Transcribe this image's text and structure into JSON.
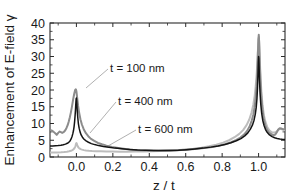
{
  "chart_data": {
    "type": "line",
    "title": "",
    "xlabel": "z / t",
    "ylabel": "Enhancement of E-field γ",
    "xlim": [
      -0.145,
      1.145
    ],
    "ylim": [
      0,
      40
    ],
    "xticks": [
      0.0,
      0.2,
      0.4,
      0.6,
      0.8,
      1.0
    ],
    "xticklabels": [
      "0.0",
      "0.2",
      "0.4",
      "0.6",
      "0.8",
      "1.0"
    ],
    "yticks": [
      0,
      5,
      10,
      15,
      20,
      25,
      30,
      35,
      40
    ],
    "yticklabels": [
      "0",
      "5",
      "10",
      "15",
      "20",
      "25",
      "30",
      "35",
      "40"
    ],
    "grid": false,
    "legend_position": "inline-annotations",
    "annotations": [
      {
        "text": "t = 100 nm",
        "x_px": 110,
        "y_px": 72,
        "leader_to_x_px": 86,
        "leader_to_y_px": 88
      },
      {
        "text": "t = 400 nm",
        "x_px": 118,
        "y_px": 105,
        "leader_to_x_px": 90,
        "leader_to_y_px": 133
      },
      {
        "text": "t = 600 nm",
        "x_px": 138,
        "y_px": 133,
        "leader_to_x_px": 108,
        "leader_to_y_px": 146
      }
    ],
    "series": [
      {
        "name": "t = 100 nm",
        "color": "#8c8c8c",
        "linewidth": 2.0,
        "points": [
          [
            -0.145,
            8.0
          ],
          [
            -0.135,
            7.9
          ],
          [
            -0.125,
            7.5
          ],
          [
            -0.115,
            7.0
          ],
          [
            -0.108,
            6.6
          ],
          [
            -0.1,
            7.2
          ],
          [
            -0.092,
            7.6
          ],
          [
            -0.085,
            7.4
          ],
          [
            -0.078,
            7.2
          ],
          [
            -0.07,
            7.4
          ],
          [
            -0.062,
            7.9
          ],
          [
            -0.055,
            8.6
          ],
          [
            -0.048,
            9.5
          ],
          [
            -0.042,
            10.6
          ],
          [
            -0.036,
            11.9
          ],
          [
            -0.03,
            13.4
          ],
          [
            -0.024,
            15.2
          ],
          [
            -0.018,
            17.2
          ],
          [
            -0.012,
            18.9
          ],
          [
            -0.007,
            20.0
          ],
          [
            -0.003,
            20.2
          ],
          [
            0.0,
            19.6
          ],
          [
            0.004,
            17.8
          ],
          [
            0.009,
            15.4
          ],
          [
            0.015,
            13.2
          ],
          [
            0.022,
            11.3
          ],
          [
            0.03,
            9.7
          ],
          [
            0.04,
            8.3
          ],
          [
            0.052,
            7.1
          ],
          [
            0.065,
            6.2
          ],
          [
            0.08,
            5.4
          ],
          [
            0.098,
            4.8
          ],
          [
            0.118,
            4.2
          ],
          [
            0.14,
            3.8
          ],
          [
            0.165,
            3.4
          ],
          [
            0.195,
            3.0
          ],
          [
            0.23,
            2.7
          ],
          [
            0.27,
            2.4
          ],
          [
            0.31,
            2.2
          ],
          [
            0.35,
            2.05
          ],
          [
            0.4,
            1.95
          ],
          [
            0.45,
            1.9
          ],
          [
            0.5,
            1.95
          ],
          [
            0.55,
            2.05
          ],
          [
            0.6,
            2.2
          ],
          [
            0.65,
            2.4
          ],
          [
            0.7,
            2.7
          ],
          [
            0.745,
            3.0
          ],
          [
            0.785,
            3.4
          ],
          [
            0.82,
            3.9
          ],
          [
            0.85,
            4.4
          ],
          [
            0.878,
            5.1
          ],
          [
            0.9,
            5.8
          ],
          [
            0.92,
            6.7
          ],
          [
            0.937,
            7.8
          ],
          [
            0.951,
            9.2
          ],
          [
            0.962,
            10.8
          ],
          [
            0.971,
            12.6
          ],
          [
            0.978,
            14.8
          ],
          [
            0.984,
            17.6
          ],
          [
            0.989,
            21.0
          ],
          [
            0.993,
            25.5
          ],
          [
            0.996,
            30.5
          ],
          [
            0.999,
            35.0
          ],
          [
            1.001,
            36.5
          ],
          [
            1.003,
            34.5
          ],
          [
            1.006,
            29.0
          ],
          [
            1.01,
            23.0
          ],
          [
            1.015,
            18.0
          ],
          [
            1.021,
            14.2
          ],
          [
            1.028,
            11.5
          ],
          [
            1.036,
            9.6
          ],
          [
            1.046,
            8.2
          ],
          [
            1.058,
            7.3
          ],
          [
            1.07,
            6.8
          ],
          [
            1.082,
            6.5
          ],
          [
            1.092,
            6.7
          ],
          [
            1.1,
            7.4
          ],
          [
            1.108,
            8.2
          ],
          [
            1.116,
            8.6
          ],
          [
            1.124,
            8.5
          ],
          [
            1.132,
            8.3
          ],
          [
            1.14,
            8.3
          ],
          [
            1.145,
            8.4
          ]
        ]
      },
      {
        "name": "t = 400 nm",
        "color": "#141414",
        "linewidth": 1.5,
        "points": [
          [
            -0.145,
            3.25
          ],
          [
            -0.13,
            3.3
          ],
          [
            -0.115,
            3.35
          ],
          [
            -0.1,
            3.4
          ],
          [
            -0.085,
            3.5
          ],
          [
            -0.072,
            3.65
          ],
          [
            -0.06,
            3.85
          ],
          [
            -0.05,
            4.1
          ],
          [
            -0.042,
            4.4
          ],
          [
            -0.035,
            4.8
          ],
          [
            -0.029,
            5.4
          ],
          [
            -0.024,
            6.1
          ],
          [
            -0.02,
            6.9
          ],
          [
            -0.016,
            7.9
          ],
          [
            -0.013,
            9.0
          ],
          [
            -0.01,
            10.5
          ],
          [
            -0.0075,
            12.2
          ],
          [
            -0.005,
            14.2
          ],
          [
            -0.003,
            16.2
          ],
          [
            -0.0015,
            17.4
          ],
          [
            0.0,
            17.6
          ],
          [
            0.0015,
            16.8
          ],
          [
            0.003,
            15.2
          ],
          [
            0.005,
            13.4
          ],
          [
            0.008,
            11.5
          ],
          [
            0.011,
            9.9
          ],
          [
            0.015,
            8.6
          ],
          [
            0.02,
            7.5
          ],
          [
            0.026,
            6.6
          ],
          [
            0.033,
            5.9
          ],
          [
            0.042,
            5.3
          ],
          [
            0.053,
            4.8
          ],
          [
            0.066,
            4.4
          ],
          [
            0.082,
            4.0
          ],
          [
            0.1,
            3.7
          ],
          [
            0.122,
            3.4
          ],
          [
            0.148,
            3.15
          ],
          [
            0.178,
            2.9
          ],
          [
            0.212,
            2.65
          ],
          [
            0.25,
            2.45
          ],
          [
            0.292,
            2.25
          ],
          [
            0.335,
            2.1
          ],
          [
            0.38,
            2.0
          ],
          [
            0.425,
            1.93
          ],
          [
            0.47,
            1.92
          ],
          [
            0.515,
            1.96
          ],
          [
            0.56,
            2.05
          ],
          [
            0.605,
            2.2
          ],
          [
            0.65,
            2.4
          ],
          [
            0.695,
            2.65
          ],
          [
            0.738,
            2.95
          ],
          [
            0.778,
            3.3
          ],
          [
            0.815,
            3.75
          ],
          [
            0.848,
            4.25
          ],
          [
            0.878,
            4.85
          ],
          [
            0.903,
            5.5
          ],
          [
            0.924,
            6.3
          ],
          [
            0.941,
            7.2
          ],
          [
            0.955,
            8.3
          ],
          [
            0.966,
            9.5
          ],
          [
            0.975,
            11.0
          ],
          [
            0.982,
            12.8
          ],
          [
            0.987,
            14.8
          ],
          [
            0.991,
            17.4
          ],
          [
            0.994,
            20.5
          ],
          [
            0.9965,
            24.5
          ],
          [
            0.9985,
            28.2
          ],
          [
            1.0,
            30.0
          ],
          [
            1.0015,
            29.4
          ],
          [
            1.003,
            26.8
          ],
          [
            1.005,
            23.0
          ],
          [
            1.008,
            19.2
          ],
          [
            1.012,
            15.8
          ],
          [
            1.017,
            13.0
          ],
          [
            1.023,
            10.9
          ],
          [
            1.03,
            9.4
          ],
          [
            1.038,
            8.2
          ],
          [
            1.048,
            7.3
          ],
          [
            1.06,
            6.6
          ],
          [
            1.074,
            6.1
          ],
          [
            1.088,
            5.75
          ],
          [
            1.102,
            5.5
          ],
          [
            1.116,
            5.35
          ],
          [
            1.13,
            5.28
          ],
          [
            1.145,
            5.25
          ]
        ]
      },
      {
        "name": "t = 600 nm",
        "color": "#bdbdbd",
        "linewidth": 2.0,
        "points": [
          [
            -0.145,
            1.35
          ],
          [
            -0.125,
            1.35
          ],
          [
            -0.105,
            1.38
          ],
          [
            -0.085,
            1.42
          ],
          [
            -0.068,
            1.48
          ],
          [
            -0.052,
            1.58
          ],
          [
            -0.04,
            1.7
          ],
          [
            -0.03,
            1.85
          ],
          [
            -0.022,
            2.05
          ],
          [
            -0.016,
            2.3
          ],
          [
            -0.011,
            2.6
          ],
          [
            -0.0075,
            2.95
          ],
          [
            -0.005,
            3.35
          ],
          [
            -0.003,
            3.75
          ],
          [
            -0.0015,
            4.05
          ],
          [
            0.0,
            4.15
          ],
          [
            0.0015,
            4.05
          ],
          [
            0.003,
            3.8
          ],
          [
            0.005,
            3.45
          ],
          [
            0.008,
            3.1
          ],
          [
            0.012,
            2.8
          ],
          [
            0.017,
            2.55
          ],
          [
            0.023,
            2.35
          ],
          [
            0.031,
            2.2
          ],
          [
            0.041,
            2.05
          ],
          [
            0.053,
            1.95
          ],
          [
            0.068,
            1.85
          ],
          [
            0.086,
            1.78
          ],
          [
            0.108,
            1.72
          ],
          [
            0.134,
            1.68
          ],
          [
            0.164,
            1.65
          ],
          [
            0.198,
            1.62
          ],
          [
            0.236,
            1.6
          ],
          [
            0.278,
            1.6
          ],
          [
            0.322,
            1.62
          ],
          [
            0.368,
            1.66
          ],
          [
            0.414,
            1.72
          ],
          [
            0.46,
            1.8
          ],
          [
            0.506,
            1.9
          ],
          [
            0.552,
            2.05
          ],
          [
            0.598,
            2.25
          ],
          [
            0.642,
            2.5
          ],
          [
            0.686,
            2.8
          ],
          [
            0.728,
            3.2
          ],
          [
            0.768,
            3.7
          ],
          [
            0.805,
            4.3
          ],
          [
            0.838,
            5.0
          ],
          [
            0.868,
            5.9
          ],
          [
            0.894,
            6.9
          ],
          [
            0.916,
            8.1
          ],
          [
            0.934,
            9.5
          ],
          [
            0.949,
            11.2
          ],
          [
            0.961,
            13.2
          ],
          [
            0.971,
            15.6
          ],
          [
            0.979,
            18.4
          ],
          [
            0.985,
            21.6
          ],
          [
            0.99,
            25.2
          ],
          [
            0.994,
            29.0
          ],
          [
            0.997,
            32.5
          ],
          [
            0.9995,
            35.2
          ],
          [
            1.0015,
            35.8
          ],
          [
            1.004,
            33.0
          ],
          [
            1.007,
            28.5
          ],
          [
            1.011,
            23.5
          ],
          [
            1.016,
            19.0
          ],
          [
            1.022,
            15.3
          ],
          [
            1.029,
            12.5
          ],
          [
            1.038,
            10.4
          ],
          [
            1.048,
            8.9
          ],
          [
            1.06,
            7.9
          ],
          [
            1.073,
            7.4
          ],
          [
            1.086,
            7.3
          ],
          [
            1.098,
            7.6
          ],
          [
            1.108,
            8.1
          ],
          [
            1.118,
            8.4
          ],
          [
            1.128,
            8.3
          ],
          [
            1.138,
            8.1
          ],
          [
            1.145,
            8.0
          ]
        ]
      }
    ]
  },
  "axes": {
    "x_label": "z / t",
    "y_label": "Enhancement of E-field γ"
  }
}
